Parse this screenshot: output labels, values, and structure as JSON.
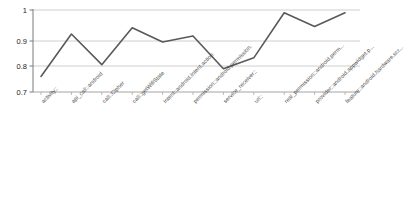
{
  "chart_data": {
    "type": "line",
    "title": "",
    "xlabel": "",
    "ylabel": "",
    "ylim": [
      0.7,
      1.0
    ],
    "yticks": [
      "0.7",
      "0.8",
      "0.9",
      "1"
    ],
    "ytick_values": [
      0.7,
      0.8,
      0.9,
      1.0
    ],
    "grid": true,
    "legend": "none",
    "categories": [
      "activity::",
      "api_call::android",
      "call::Cipher",
      "call::getWifiState",
      "intent::android.intent.action",
      "permission::android.permission.",
      "service_receiver::",
      "url::",
      "real_permission::android.perm...",
      "provider::android.appwidget.p...",
      "feature::android.hardware.scr..."
    ],
    "values": [
      0.757,
      0.912,
      0.8,
      0.935,
      0.883,
      0.905,
      0.785,
      0.825,
      0.99,
      0.94,
      0.99
    ],
    "series": [
      {
        "name": "accuracy",
        "values": [
          0.757,
          0.912,
          0.8,
          0.935,
          0.883,
          0.905,
          0.785,
          0.825,
          0.99,
          0.94,
          0.99
        ],
        "color": "#595959"
      }
    ]
  },
  "style": {
    "line_color": "#595959",
    "grid_color": "#c8c8c8",
    "axis_color": "#808080",
    "tick_color": "#222222",
    "background": "#ffffff"
  }
}
